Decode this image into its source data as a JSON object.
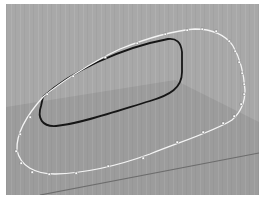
{
  "viewport": {
    "type": "3d-perspective-viewport",
    "background_color": "#a8a8a8",
    "ground_plane_color": "#9b9b9b",
    "grid_stripe_color": "#b2b2b2",
    "horizon_line_color": "#6e6e6e"
  },
  "objects": [
    {
      "name": "outer-curve",
      "type": "nurbs-curve",
      "selected": true,
      "color": "#f2f2f2",
      "control_points_visible": true,
      "control_point_count": 28
    },
    {
      "name": "inner-curve",
      "type": "closed-curve",
      "selected": false,
      "color": "#1a1a1a"
    }
  ]
}
